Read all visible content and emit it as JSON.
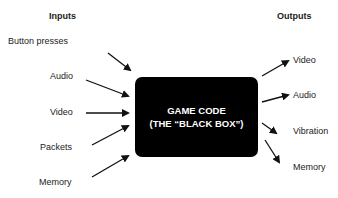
{
  "inputs": {
    "header": "Inputs",
    "items": [
      "Button presses",
      "Audio",
      "Video",
      "Packets",
      "Memory"
    ]
  },
  "outputs": {
    "header": "Outputs",
    "items": [
      "Video",
      "Audio",
      "Vibration",
      "Memory"
    ]
  },
  "black_box": {
    "line1": "GAME CODE",
    "line2": "(THE “BLACK BOX”)"
  }
}
